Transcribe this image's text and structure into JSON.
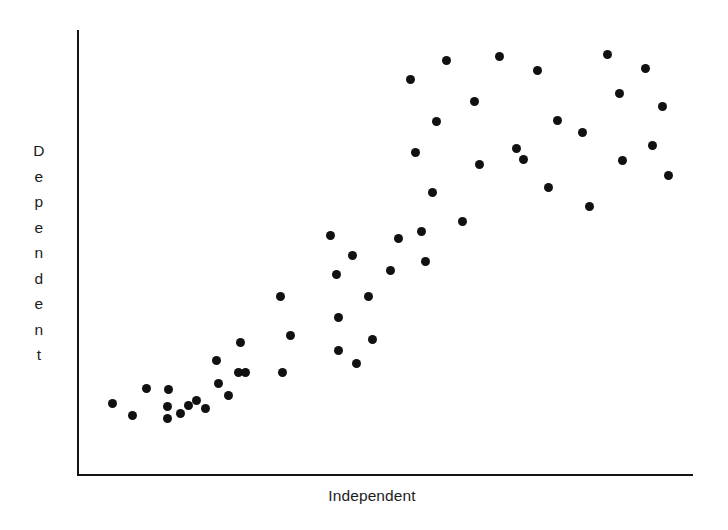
{
  "figure": {
    "background_color": "#ffffff",
    "axis_color": "#141414",
    "point_color": "#111111",
    "width": 728,
    "height": 530
  },
  "axes": {
    "y_axis_label": "Dependent",
    "x_axis_label": "Independent",
    "y_axis_label_letters": [
      "D",
      "e",
      "p",
      "e",
      "n",
      "d",
      "e",
      "n",
      "t"
    ]
  },
  "chart_data": {
    "type": "scatter",
    "title": "",
    "xlabel": "Independent",
    "ylabel": "Dependent",
    "grid": false,
    "legend": null,
    "xlim": [
      0,
      100
    ],
    "ylim": [
      0,
      100
    ],
    "axis_ticks": {
      "x": [],
      "y": []
    },
    "marker": {
      "shape": "circle",
      "color": "#111111",
      "size_px": 9
    },
    "n_points": 54,
    "points_px": [
      [
        112,
        403
      ],
      [
        132,
        415
      ],
      [
        146,
        388
      ],
      [
        167,
        418
      ],
      [
        167,
        406
      ],
      [
        168,
        389
      ],
      [
        180,
        413
      ],
      [
        188,
        405
      ],
      [
        196,
        400
      ],
      [
        205,
        408
      ],
      [
        216,
        360
      ],
      [
        218,
        383
      ],
      [
        228,
        395
      ],
      [
        238,
        372
      ],
      [
        240,
        342
      ],
      [
        245,
        372
      ],
      [
        280,
        296
      ],
      [
        282,
        372
      ],
      [
        290,
        335
      ],
      [
        330,
        235
      ],
      [
        336,
        274
      ],
      [
        338,
        317
      ],
      [
        338,
        350
      ],
      [
        352,
        255
      ],
      [
        356,
        363
      ],
      [
        368,
        296
      ],
      [
        372,
        339
      ],
      [
        390,
        270
      ],
      [
        398,
        238
      ],
      [
        410,
        79
      ],
      [
        415,
        152
      ],
      [
        421,
        231
      ],
      [
        425,
        261
      ],
      [
        432,
        192
      ],
      [
        436,
        121
      ],
      [
        446,
        60
      ],
      [
        462,
        221
      ],
      [
        474,
        101
      ],
      [
        479,
        164
      ],
      [
        499,
        56
      ],
      [
        516,
        148
      ],
      [
        523,
        159
      ],
      [
        537,
        70
      ],
      [
        548,
        187
      ],
      [
        557,
        120
      ],
      [
        582,
        132
      ],
      [
        589,
        206
      ],
      [
        607,
        54
      ],
      [
        619,
        93
      ],
      [
        622,
        160
      ],
      [
        645,
        68
      ],
      [
        652,
        145
      ],
      [
        662,
        106
      ],
      [
        668,
        175
      ]
    ],
    "x": [
      5.7,
      8.9,
      11.2,
      14.6,
      14.6,
      14.8,
      16.7,
      18.0,
      19.3,
      20.8,
      22.6,
      22.9,
      24.5,
      26.1,
      26.5,
      27.3,
      32.9,
      33.1,
      34.4,
      41.1,
      42.0,
      42.4,
      42.4,
      44.6,
      45.3,
      47.2,
      47.9,
      50.8,
      52.1,
      54.0,
      54.9,
      55.8,
      56.5,
      57.6,
      58.3,
      59.9,
      62.5,
      64.4,
      65.1,
      68.3,
      71.1,
      72.2,
      74.7,
      76.5,
      77.9,
      81.9,
      83.0,
      86.0,
      88.0,
      88.5,
      92.2,
      93.4,
      95.0,
      96.0
    ],
    "y": [
      16.0,
      13.2,
      19.3,
      12.5,
      15.2,
      19.0,
      13.5,
      15.2,
      16.4,
      14.6,
      25.4,
      20.2,
      17.7,
      22.6,
      29.3,
      22.6,
      39.7,
      22.6,
      31.4,
      53.1,
      44.4,
      34.8,
      27.4,
      49.0,
      24.4,
      39.7,
      30.0,
      45.5,
      50.7,
      86.3,
      70.0,
      52.1,
      45.6,
      63.3,
      79.1,
      92.7,
      55.0,
      83.4,
      69.3,
      93.7,
      71.1,
      68.6,
      90.6,
      62.1,
      77.1,
      74.4,
      58.4,
      94.2,
      85.1,
      68.3,
      90.9,
      72.9,
      81.4,
      65.1
    ]
  }
}
